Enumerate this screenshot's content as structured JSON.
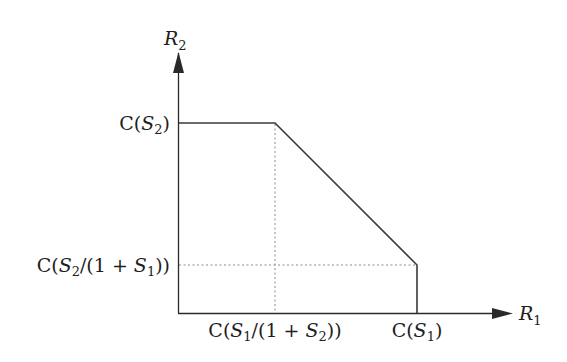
{
  "diagram": {
    "type": "capacity-region",
    "axes": {
      "x_label": {
        "main": "R",
        "sub": "1"
      },
      "y_label": {
        "main": "R",
        "sub": "2"
      }
    },
    "ticks": {
      "y_top": {
        "prefix": "C(",
        "var": "S",
        "sub": "2",
        "suffix": ")"
      },
      "y_bottom": {
        "prefix": "C(",
        "var1": "S",
        "sub1": "2",
        "mid": "/(1 + ",
        "var2": "S",
        "sub2": "1",
        "suffix": "))"
      },
      "x_left": {
        "prefix": "C(",
        "var1": "S",
        "sub1": "1",
        "mid": "/(1 + ",
        "var2": "S",
        "sub2": "2",
        "suffix": "))"
      },
      "x_right": {
        "prefix": "C(",
        "var": "S",
        "sub": "1",
        "suffix": ")"
      }
    },
    "region_vertices": [
      {
        "name": "origin",
        "x": 0,
        "y": "0"
      },
      {
        "name": "top-left",
        "x": "0",
        "y": "C(S2)"
      },
      {
        "name": "corner-1",
        "x": "C(S1/(1+S2))",
        "y": "C(S2)"
      },
      {
        "name": "corner-2",
        "x": "C(S1)",
        "y": "C(S2/(1+S1))"
      },
      {
        "name": "bottom-right",
        "x": "C(S1)",
        "y": "0"
      }
    ],
    "colors": {
      "line": "#3a3a3a",
      "dotted": "#8a8a8a",
      "text": "#1e1e1e",
      "background": "#ffffff"
    }
  }
}
